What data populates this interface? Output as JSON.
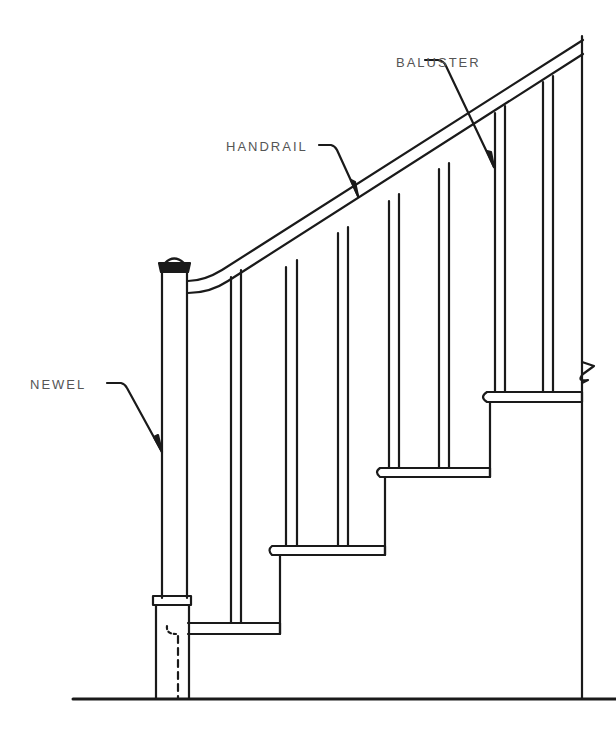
{
  "diagram": {
    "type": "staircase-elevation",
    "colors": {
      "ink": "#1a1a1a",
      "label": "#555555",
      "background": "#ffffff"
    },
    "labels": [
      {
        "id": "baluster",
        "text": "BALUSTER",
        "x": 396,
        "y": 56
      },
      {
        "id": "handrail",
        "text": "HANDRAIL",
        "x": 226,
        "y": 140
      },
      {
        "id": "newel",
        "text": "NEWEL",
        "x": 30,
        "y": 378
      }
    ],
    "parts": [
      "Newel",
      "Handrail",
      "Baluster",
      "Treads",
      "Risers",
      "Floor",
      "Wall"
    ]
  }
}
